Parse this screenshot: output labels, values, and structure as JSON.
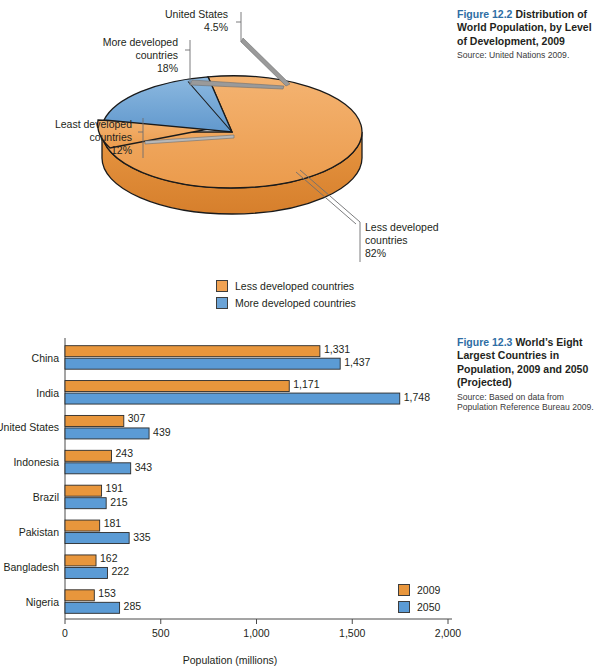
{
  "figure_122": {
    "fignum": "Figure 12.2",
    "title": "Distribution of World Population, by Level of Development, 2009",
    "source": "Source: United Nations 2009.",
    "callouts": [
      {
        "name": "united-states",
        "lines": [
          "United States",
          "4.5%"
        ]
      },
      {
        "name": "more-developed",
        "lines": [
          "More developed",
          "countries",
          "18%"
        ]
      },
      {
        "name": "least-developed",
        "lines": [
          "Least developed",
          "countries",
          "12%"
        ]
      },
      {
        "name": "less-developed",
        "lines": [
          "Less developed",
          "countries",
          "82%"
        ]
      }
    ],
    "legend": [
      {
        "label": "Less developed countries",
        "color": "#f0a253"
      },
      {
        "label": "More developed countries",
        "color": "#6ba3d6"
      }
    ]
  },
  "figure_123": {
    "fignum": "Figure 12.3",
    "title": "World’s Eight Largest Countries in Population, 2009 and 2050 (Projected)",
    "source": "Source: Based on data from Population Reference Bureau 2009."
  },
  "chart_data": [
    {
      "type": "pie",
      "title": "Distribution of World Population, by Level of Development, 2009",
      "labels": [
        "Less developed countries",
        "More developed countries",
        "Least developed countries",
        "United States"
      ],
      "values": [
        82,
        18,
        12,
        4.5
      ],
      "value_labels": [
        "82%",
        "18%",
        "12%",
        "4.5%"
      ],
      "slices": [
        {
          "name": "Less developed countries",
          "percent": 82,
          "color": "#f0a253"
        },
        {
          "name": "More developed countries",
          "percent": 18,
          "color": "#6ba3d6"
        }
      ],
      "legend_position": "bottom",
      "notes": "3-D exploded pie; More developed countries slice is subdivided, United States 4.5% and Least developed countries 12% are called out."
    },
    {
      "type": "bar",
      "orientation": "horizontal",
      "title": "World’s Eight Largest Countries in Population, 2009 and 2050 (Projected)",
      "categories": [
        "China",
        "India",
        "United States",
        "Indonesia",
        "Brazil",
        "Pakistan",
        "Bangladesh",
        "Nigeria"
      ],
      "series": [
        {
          "name": "2009",
          "color": "#e8963c",
          "values": [
            1331,
            1171,
            307,
            243,
            191,
            181,
            162,
            153
          ],
          "value_labels": [
            "1,331",
            "1,171",
            "307",
            "243",
            "191",
            "181",
            "162",
            "153"
          ]
        },
        {
          "name": "2050",
          "color": "#5b9bd5",
          "values": [
            1437,
            1748,
            439,
            343,
            215,
            335,
            222,
            285
          ],
          "value_labels": [
            "1,437",
            "1,748",
            "439",
            "343",
            "215",
            "335",
            "222",
            "285"
          ]
        }
      ],
      "xlabel": "Population (millions)",
      "ylabel": "",
      "xlim": [
        0,
        2000
      ],
      "xticks": [
        0,
        500,
        1000,
        1500,
        2000
      ],
      "xtick_labels": [
        "0",
        "500",
        "1,000",
        "1,500",
        "2,000"
      ],
      "grid": false,
      "legend_position": "inside-right"
    }
  ]
}
